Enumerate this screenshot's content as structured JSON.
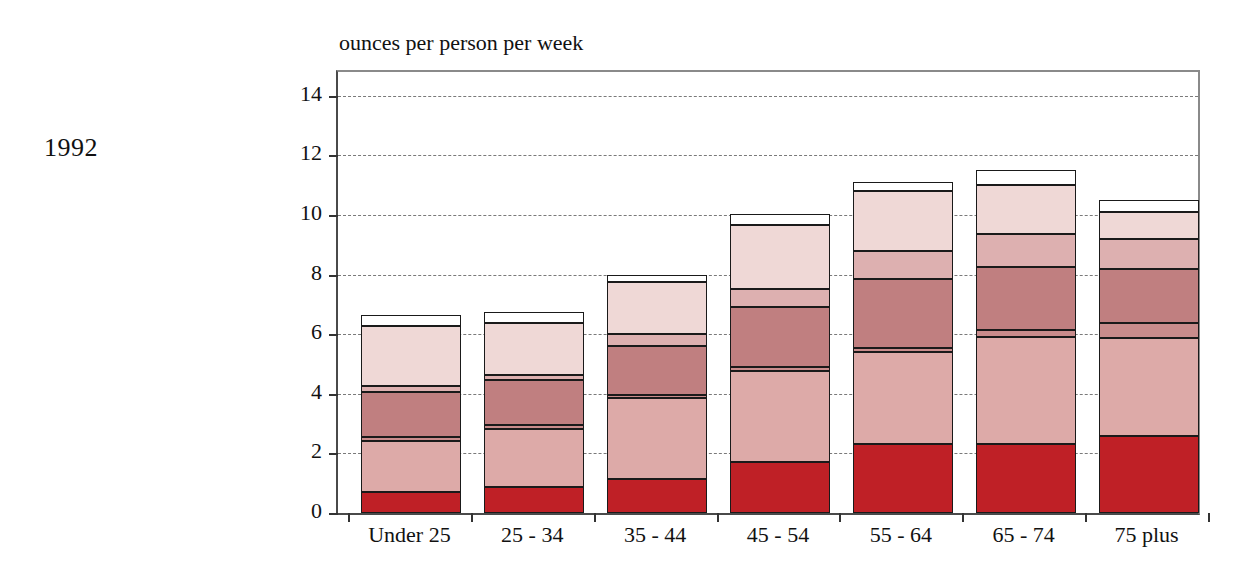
{
  "year_label": "1992",
  "axis_title": "ounces per person per week",
  "chart_data": {
    "type": "bar",
    "subtype": "stacked",
    "title": "",
    "subtitle": "",
    "annotation": "1992",
    "xlabel": "",
    "ylabel": "ounces per person per week",
    "ylim": [
      0,
      14.8
    ],
    "yticks": [
      0,
      2,
      4,
      6,
      8,
      10,
      12,
      14
    ],
    "ytick_labels": [
      "0",
      "2",
      "4",
      "6",
      "8",
      "10",
      "12",
      "14"
    ],
    "grid": true,
    "grid_axis": "y",
    "legend": "none",
    "categories": [
      "Under 25",
      "25 - 34",
      "35 - 44",
      "45 - 54",
      "55 - 64",
      "65 - 74",
      "75 plus"
    ],
    "colors": {
      "s1": "#bf2026",
      "s2": "#ddaaa8",
      "s3": "#c98c8c",
      "s4": "#c07f80",
      "s5": "#ddb0b0",
      "s6": "#efd8d6",
      "s7": "#ffffff",
      "outline": "#1a1a1a",
      "grid": "#7a7a7a",
      "axis": "#333333",
      "text": "#111111"
    },
    "series": [
      {
        "name": "s1",
        "color": "#bf2026",
        "values": [
          0.7,
          0.88,
          1.15,
          1.72,
          2.3,
          2.3,
          2.58
        ]
      },
      {
        "name": "s2",
        "color": "#ddaaa8",
        "values": [
          1.7,
          1.95,
          2.7,
          3.03,
          3.1,
          3.6,
          3.3
        ]
      },
      {
        "name": "s3",
        "color": "#c98c8c",
        "values": [
          0.15,
          0.12,
          0.1,
          0.15,
          0.15,
          0.25,
          0.5
        ]
      },
      {
        "name": "s4",
        "color": "#c07f80",
        "values": [
          1.5,
          1.5,
          1.65,
          2.0,
          2.3,
          2.1,
          1.8
        ]
      },
      {
        "name": "s5",
        "color": "#ddb0b0",
        "values": [
          0.22,
          0.18,
          0.42,
          0.62,
          0.95,
          1.1,
          1.0
        ]
      },
      {
        "name": "s6",
        "color": "#efd8d6",
        "values": [
          2.0,
          1.75,
          1.73,
          2.13,
          2.0,
          1.65,
          0.92
        ]
      },
      {
        "name": "s7",
        "color": "#ffffff",
        "values": [
          0.38,
          0.35,
          0.25,
          0.4,
          0.3,
          0.5,
          0.4
        ]
      }
    ],
    "totals": [
      6.65,
      6.33,
      8.0,
      10.05,
      11.1,
      11.5,
      10.5
    ]
  }
}
